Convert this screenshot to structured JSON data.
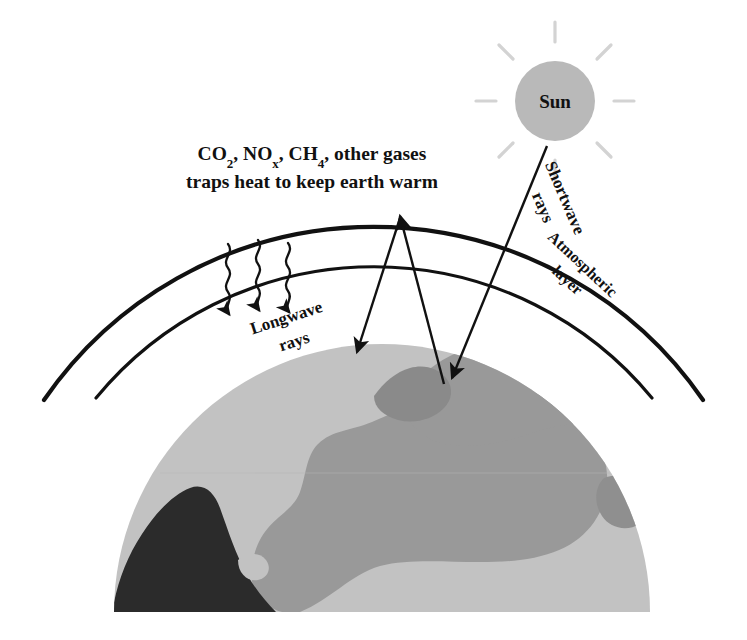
{
  "diagram": {
    "title_caption": {
      "line1": "CO2, NOx, CH4, other gases",
      "line2": "traps heat to keep earth warm",
      "line1_parts": {
        "co2_base": "CO",
        "co2_sub": "2",
        "sep1": ", ",
        "nox_base": "NO",
        "nox_sub": "x",
        "sep2": ", ",
        "ch4_base": "CH",
        "ch4_sub": "4",
        "tail": ", other gases"
      }
    },
    "sun": {
      "label": "Sun",
      "fill_color": "#b9b9b9",
      "ray_color": "#d3d3d3"
    },
    "labels": {
      "shortwave": "Shortwave rays",
      "shortwave_line1": "Shortwave",
      "shortwave_line2": "rays",
      "longwave_line1": "Longwave",
      "longwave_line2": "rays",
      "atmospheric_line1": "Atmospheric",
      "atmospheric_line2": "layer"
    },
    "earth": {
      "ocean_color": "#c2c2c2",
      "land_color": "#999999",
      "dark_color": "#2b2b2b"
    },
    "stroke_color": "#111111",
    "atmosphere": {
      "outer_arc_apex_y": 203,
      "inner_arc_apex_y": 243
    }
  }
}
